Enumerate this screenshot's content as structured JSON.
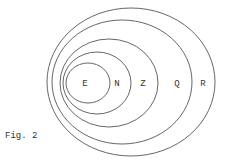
{
  "figure": {
    "caption": "Fig. 2",
    "stroke_color": "#555555",
    "sets": [
      {
        "label": "R",
        "cx": 131,
        "cy": 82,
        "rx": 84,
        "ry": 74,
        "label_x": 203,
        "label_y": 86
      },
      {
        "label": "Q",
        "cx": 122,
        "cy": 82,
        "rx": 70,
        "ry": 62,
        "label_x": 177,
        "label_y": 86
      },
      {
        "label": "Z",
        "cx": 109,
        "cy": 83,
        "rx": 49,
        "ry": 44,
        "label_x": 143,
        "label_y": 86
      },
      {
        "label": "N",
        "cx": 97,
        "cy": 83,
        "rx": 34,
        "ry": 31,
        "label_x": 117,
        "label_y": 86
      },
      {
        "label": "E",
        "cx": 88,
        "cy": 83,
        "rx": 22,
        "ry": 20,
        "label_x": 85,
        "label_y": 86
      }
    ]
  }
}
